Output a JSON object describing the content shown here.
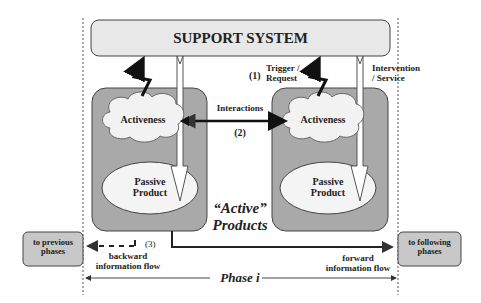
{
  "diagram": {
    "support_system": {
      "label": "SUPPORT SYSTEM"
    },
    "left_product": {
      "activeness_label": "Activeness",
      "passive_label_line1": "Passive",
      "passive_label_line2": "Product"
    },
    "right_product": {
      "activeness_label": "Activeness",
      "passive_label_line1": "Passive",
      "passive_label_line2": "Product"
    },
    "labels": {
      "trigger_number": "(1)",
      "trigger_line1": "Trigger /",
      "trigger_line2": "Request",
      "intervention_line1": "Intervention",
      "intervention_line2": "/ Service",
      "interactions": "Interactions",
      "interactions_number": "(2)",
      "active_products_line1": "“Active”",
      "active_products_line2": "Products",
      "backward_number": "(3)",
      "backward_line1": "backward",
      "backward_line2": "information flow",
      "forward_line1": "forward",
      "forward_line2": "information flow",
      "phase": "Phase i"
    },
    "side_boxes": {
      "previous_line1": "to previous",
      "previous_line2": "phases",
      "following_line1": "to following",
      "following_line2": "phases"
    },
    "colors": {
      "support_fill": "#e8e8e8",
      "product_fill": "#a9a9a9",
      "cloud_fill": "#f2f2f2",
      "ellipse_fill": "#f4f4f4",
      "side_box_fill": "#c8c8c8",
      "stroke": "#333333"
    }
  }
}
